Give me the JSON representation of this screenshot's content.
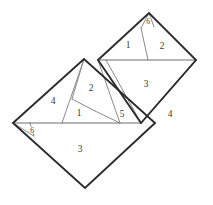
{
  "figure": {
    "canvas": {
      "width": 213,
      "height": 205
    },
    "colors": {
      "background": "#ffffff",
      "outer_stroke": "#2b2b2b",
      "inner_stroke": "#8a8a8a",
      "mid_stroke": "#6f6f6f",
      "label_text": "#3a3a3a"
    }
  },
  "shapes": {
    "left_square": {
      "name": "left-square",
      "points": "13,123 84,59 155,123 85,188"
    },
    "right_square": {
      "name": "right-square",
      "points": "98,60 149,13 196,60 141,123"
    }
  },
  "outer_edges": [
    {
      "name": "left-square-outline",
      "d": "M 13,123 L 84,59 L 155,123 L 85,188 Z"
    },
    {
      "name": "right-square-outline",
      "d": "M 98,60 L 149,13 L 196,60 L 141,123 Z"
    }
  ],
  "mid_edges": [
    {
      "name": "left-square-horizontal-chord",
      "d": "M 13,123 L 141,123"
    },
    {
      "name": "right-square-top-chord",
      "d": "M 98,60 L 196,60"
    }
  ],
  "inner_edges": [
    {
      "name": "cut-apex-to-base-left",
      "d": "M 84,59 L 62,123"
    },
    {
      "name": "cut-apex-to-mid-left",
      "d": "M 84,59 L 72,99"
    },
    {
      "name": "cut-mid-left-to-base",
      "d": "M 72,99 L 95,111"
    },
    {
      "name": "cut-piece2-diagonal",
      "d": "M 95,111 L 120,123"
    },
    {
      "name": "cut-left-corner-small",
      "d": "M 13,123 L 34,136"
    },
    {
      "name": "cut-left-corner-small-2",
      "d": "M 30,123 L 34,136"
    },
    {
      "name": "cut-apex-top-small",
      "d": "M 149,13 L 141,28"
    },
    {
      "name": "cut-apex-top-small-2",
      "d": "M 149,13 L 154,27"
    },
    {
      "name": "cut-top-region-split",
      "d": "M 141,28 L 148,60"
    },
    {
      "name": "cut-right-diagonal",
      "d": "M 196,60 L 141,123"
    },
    {
      "name": "cut-piece5-edge",
      "d": "M 106,60 L 141,123"
    },
    {
      "name": "cut-piece5-left",
      "d": "M 98,60 L 120,123"
    }
  ],
  "labels": [
    {
      "name": "region-label-6-top",
      "text": "6",
      "x": 148,
      "y": 22,
      "size": "tiny"
    },
    {
      "name": "region-label-1-top",
      "text": "1",
      "x": 128,
      "y": 46,
      "size": "normal"
    },
    {
      "name": "region-label-2-top",
      "text": "2",
      "x": 162,
      "y": 47,
      "size": "normal"
    },
    {
      "name": "region-label-3-right",
      "text": "3",
      "x": 146,
      "y": 85,
      "size": "normal"
    },
    {
      "name": "region-label-4-right",
      "text": "4",
      "x": 170,
      "y": 115,
      "size": "normal"
    },
    {
      "name": "region-label-5-mid",
      "text": "5",
      "x": 122,
      "y": 115,
      "size": "normal"
    },
    {
      "name": "region-label-2-left",
      "text": "2",
      "x": 91,
      "y": 89,
      "size": "normal"
    },
    {
      "name": "region-label-1-left",
      "text": "1",
      "x": 79,
      "y": 114,
      "size": "normal"
    },
    {
      "name": "region-label-4-left",
      "text": "4",
      "x": 53,
      "y": 102,
      "size": "normal"
    },
    {
      "name": "region-label-6-left",
      "text": "6",
      "x": 32,
      "y": 131,
      "size": "tiny"
    },
    {
      "name": "region-label-3-bottom",
      "text": "3",
      "x": 80,
      "y": 150,
      "size": "normal"
    }
  ]
}
